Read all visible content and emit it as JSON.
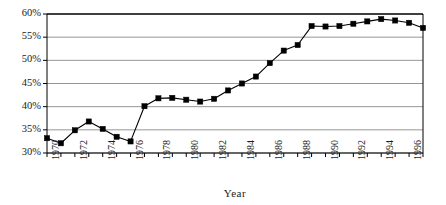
{
  "chart_data": {
    "type": "line",
    "title": "",
    "subtitle": "",
    "xlabel": "Year",
    "ylabel": "",
    "xlim": [
      1970,
      1997
    ],
    "ylim": [
      30,
      60
    ],
    "grid": "horizontal",
    "legend": "none",
    "marker": "filled-square",
    "line_color": "#000000",
    "marker_color": "#000000",
    "grid_color": "#8a8a8a",
    "axis_color": "#000000",
    "y_tick_labels": [
      "30%",
      "35%",
      "40%",
      "45%",
      "50%",
      "55%",
      "60%"
    ],
    "y_tick_values": [
      30,
      35,
      40,
      45,
      50,
      55,
      60
    ],
    "x_tick_values": [
      1970,
      1971,
      1972,
      1973,
      1974,
      1975,
      1976,
      1977,
      1978,
      1979,
      1980,
      1981,
      1982,
      1983,
      1984,
      1985,
      1986,
      1987,
      1988,
      1989,
      1990,
      1991,
      1992,
      1993,
      1994,
      1995,
      1996,
      1997
    ],
    "x_tick_labels": [
      "1970",
      "",
      "1972",
      "",
      "1974",
      "",
      "1976",
      "",
      "1978",
      "",
      "1980",
      "",
      "1982",
      "",
      "1984",
      "",
      "1986",
      "",
      "1988",
      "",
      "1990",
      "",
      "1992",
      "",
      "1994",
      "",
      "1996",
      ""
    ],
    "x": [
      1970,
      1971,
      1972,
      1973,
      1974,
      1975,
      1976,
      1977,
      1978,
      1979,
      1980,
      1981,
      1982,
      1983,
      1984,
      1985,
      1986,
      1987,
      1988,
      1989,
      1990,
      1991,
      1992,
      1993,
      1994,
      1995,
      1996,
      1997
    ],
    "values": [
      33.2,
      32.1,
      34.9,
      36.8,
      35.2,
      33.5,
      32.5,
      40.1,
      41.8,
      41.9,
      41.5,
      41.1,
      41.7,
      43.5,
      45.0,
      46.5,
      49.4,
      52.1,
      53.3,
      57.4,
      57.3,
      57.4,
      57.9,
      58.4,
      58.9,
      58.6,
      58.1,
      57.0
    ],
    "series": [
      {
        "name": "",
        "values": [
          33.2,
          32.1,
          34.9,
          36.8,
          35.2,
          33.5,
          32.5,
          40.1,
          41.8,
          41.9,
          41.5,
          41.1,
          41.7,
          43.5,
          45.0,
          46.5,
          49.4,
          52.1,
          53.3,
          57.4,
          57.3,
          57.4,
          57.9,
          58.4,
          58.9,
          58.6,
          58.1,
          57.0
        ]
      }
    ],
    "annotations": []
  },
  "layout": {
    "plot_left": 47,
    "plot_right": 423,
    "plot_top": 14,
    "plot_bottom": 153
  }
}
